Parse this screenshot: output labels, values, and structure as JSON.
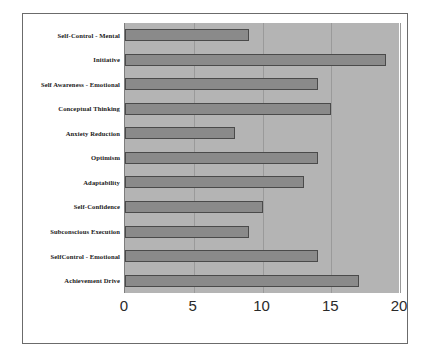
{
  "chart_data": {
    "type": "bar",
    "orientation": "horizontal",
    "title": "",
    "xlabel": "",
    "ylabel": "",
    "xlim": [
      0,
      20
    ],
    "xticks": [
      0,
      5,
      10,
      15,
      20
    ],
    "xtick_labels": [
      "0",
      "5",
      "10",
      "15",
      "20"
    ],
    "grid": true,
    "legend": false,
    "categories": [
      "Self-Control - Mental",
      "Initiative",
      "Self Awareness - Emotional",
      "Conceptual Thinking",
      "Anxiety Reduction",
      "Optimism",
      "Adaptability",
      "Self-Confidence",
      "Subconscious Execution",
      "SelfControl - Emotional",
      "Achievement Drive"
    ],
    "values": [
      9,
      19,
      14,
      15,
      8,
      14,
      13,
      10,
      9,
      14,
      17
    ],
    "colors": {
      "bar_fill": "#8a8a8a",
      "bar_border": "#4a4a4a",
      "plot_background": "#b4b4b4",
      "gridline": "#9a9a9a",
      "frame_border": "#6b6b6b",
      "page_background": "#ffffff",
      "label_text": "#1a1a1a"
    }
  }
}
